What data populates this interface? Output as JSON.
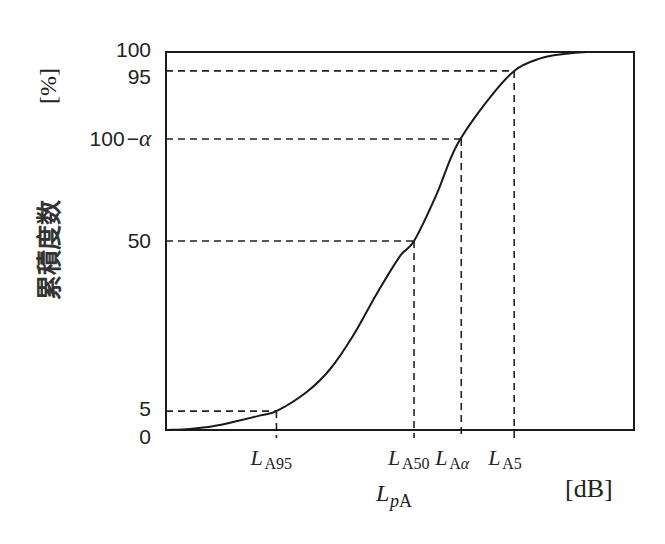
{
  "chart_data": {
    "type": "line",
    "title": "",
    "xlabel": "L_pA",
    "xlabel_main": "L",
    "xlabel_sub": "pA",
    "xunit": "[dB]",
    "ylabel": "累積度数",
    "yunit": "[%]",
    "ylim": [
      0,
      100
    ],
    "grid": false,
    "y_ticks": [
      {
        "label": "100",
        "value": 100
      },
      {
        "label": "95",
        "value": 95
      },
      {
        "label": "100−α",
        "label_num": "100",
        "label_op": "−",
        "label_var": "α",
        "value": 77
      },
      {
        "label": "50",
        "value": 50
      },
      {
        "label": "5",
        "value": 5
      },
      {
        "label": "0",
        "value": 0
      }
    ],
    "x_markers": [
      {
        "label": "L_A95",
        "main": "L",
        "sub": "A95",
        "percent": 5
      },
      {
        "label": "L_A50",
        "main": "L",
        "sub": "A50",
        "percent": 50
      },
      {
        "label": "L_Aα",
        "main": "L",
        "sub": "Aα",
        "percent": 77
      },
      {
        "label": "L_A5",
        "main": "L",
        "sub": "A5",
        "percent": 95
      }
    ],
    "series": [
      {
        "name": "cumulative frequency",
        "style": "solid",
        "x_rel": [
          0.0,
          0.05,
          0.1,
          0.15,
          0.2,
          0.236,
          0.3,
          0.35,
          0.4,
          0.45,
          0.5,
          0.53,
          0.577,
          0.62,
          0.68,
          0.744,
          0.8,
          0.85,
          0.9,
          1.0
        ],
        "values": [
          0,
          0.3,
          1.0,
          2.3,
          3.8,
          5,
          10,
          16,
          25,
          36,
          46,
          50,
          62,
          75,
          86,
          95,
          98.3,
          99.5,
          100,
          100
        ]
      }
    ],
    "reference_lines": "dashed lines from y-axis to curve and from curve down to x-axis at each marker"
  }
}
